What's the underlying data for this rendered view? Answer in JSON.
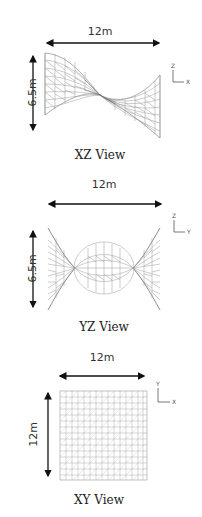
{
  "figure": {
    "views": [
      {
        "id": "xz",
        "label": "XZ View",
        "width_dim": "12m",
        "height_dim": "6.5m",
        "axes": {
          "vertical": "Z",
          "horizontal": "X"
        }
      },
      {
        "id": "yz",
        "label": "YZ View",
        "width_dim": "12m",
        "height_dim": "6.5m",
        "axes": {
          "vertical": "Z",
          "horizontal": "Y"
        }
      },
      {
        "id": "xy",
        "label": "XY View",
        "width_dim": "12m",
        "height_dim": "12m",
        "axes": {
          "vertical": "Y",
          "horizontal": "X"
        }
      }
    ],
    "colors": {
      "arrow": "#111111",
      "mesh": "#9a9a9a",
      "mesh_dark": "#6e6e6e",
      "text": "#222222"
    }
  }
}
